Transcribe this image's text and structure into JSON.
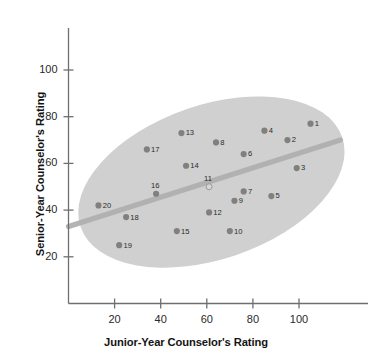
{
  "chart_data": {
    "type": "scatter",
    "title": "",
    "xlabel": "Junior-Year Counselor's Rating",
    "ylabel": "Senior-Year Counselor's Rating",
    "xlim": [
      0,
      118
    ],
    "ylim": [
      0,
      118
    ],
    "xticks": [
      20,
      40,
      60,
      80,
      100
    ],
    "yticks": [
      20,
      40,
      60,
      80,
      100
    ],
    "xtick_labels": [
      "20",
      "40",
      "60",
      "80",
      "100"
    ],
    "ytick_labels": [
      "20",
      "40",
      "60",
      "80",
      "100"
    ],
    "grid": false,
    "legend": "none",
    "point_labels": [
      "1",
      "2",
      "3",
      "4",
      "5",
      "6",
      "7",
      "8",
      "9",
      "10",
      "11",
      "12",
      "13",
      "14",
      "15",
      "16",
      "17",
      "18",
      "19",
      "20"
    ],
    "points": [
      {
        "label": "1",
        "x": 105,
        "y": 77,
        "style": "filled"
      },
      {
        "label": "2",
        "x": 95,
        "y": 70,
        "style": "filled"
      },
      {
        "label": "3",
        "x": 99,
        "y": 58,
        "style": "filled"
      },
      {
        "label": "4",
        "x": 85,
        "y": 74,
        "style": "filled"
      },
      {
        "label": "5",
        "x": 88,
        "y": 46,
        "style": "filled"
      },
      {
        "label": "6",
        "x": 76,
        "y": 64,
        "style": "filled"
      },
      {
        "label": "7",
        "x": 76,
        "y": 48,
        "style": "filled"
      },
      {
        "label": "8",
        "x": 64,
        "y": 69,
        "style": "filled"
      },
      {
        "label": "9",
        "x": 72,
        "y": 44,
        "style": "filled"
      },
      {
        "label": "10",
        "x": 70,
        "y": 31,
        "style": "filled"
      },
      {
        "label": "11",
        "x": 61,
        "y": 50,
        "style": "open"
      },
      {
        "label": "12",
        "x": 61,
        "y": 39,
        "style": "filled"
      },
      {
        "label": "13",
        "x": 49,
        "y": 73,
        "style": "filled"
      },
      {
        "label": "14",
        "x": 51,
        "y": 59,
        "style": "filled"
      },
      {
        "label": "15",
        "x": 47,
        "y": 31,
        "style": "filled"
      },
      {
        "label": "16",
        "x": 38,
        "y": 47,
        "style": "filled"
      },
      {
        "label": "17",
        "x": 34,
        "y": 66,
        "style": "filled"
      },
      {
        "label": "18",
        "x": 25,
        "y": 37,
        "style": "filled"
      },
      {
        "label": "19",
        "x": 22,
        "y": 25,
        "style": "filled"
      },
      {
        "label": "20",
        "x": 13,
        "y": 42,
        "style": "filled"
      }
    ],
    "annotations": [
      {
        "name": "regression-line",
        "type": "line",
        "x0": 0,
        "y0": 33,
        "x1": 118,
        "y1": 70
      },
      {
        "name": "correlation-ellipse",
        "type": "ellipse",
        "cx": 62,
        "cy": 52,
        "rx": 60,
        "ry": 33,
        "rotation_deg": -19
      }
    ]
  },
  "colors": {
    "point_fill": "#808080",
    "point_open_fill": "#d6d6d6",
    "ellipse_fill": "#cccccc",
    "trend_line": "#b0b0b0",
    "axis": "#6f6f6f",
    "text": "#141414",
    "background": "#ffffff"
  }
}
